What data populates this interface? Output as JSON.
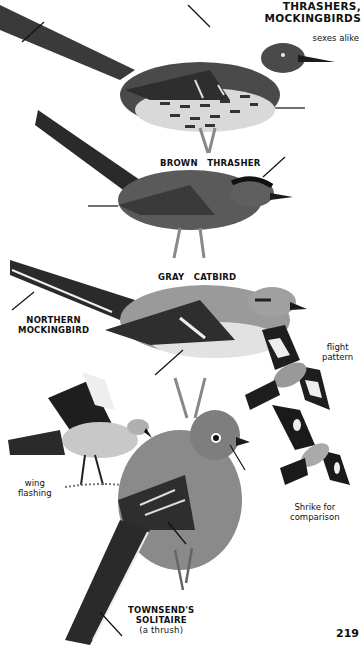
{
  "page": {
    "section_title_line1": "THRASHERS,",
    "section_title_line2": "MOCKINGBIRDS",
    "sexes_note": "sexes alike",
    "page_number": "219"
  },
  "species": [
    {
      "name_line1": "BROWN",
      "name_line2": "THRASHER"
    },
    {
      "name_line1": "GRAY",
      "name_line2": "CATBIRD"
    },
    {
      "name_line1": "NORTHERN",
      "name_line2": "MOCKINGBIRD"
    },
    {
      "name_line1": "TOWNSEND'S",
      "name_line2": "SOLITAIRE",
      "name_line3": "(a thrush)"
    }
  ],
  "captions": {
    "flight_line1": "flight",
    "flight_line2": "pattern",
    "wing_line1": "wing",
    "wing_line2": "flashing",
    "shrike_line1": "Shrike for",
    "shrike_line2": "comparison"
  },
  "colors": {
    "paper": "#ffffff",
    "ink": "#111111",
    "dark_plumage": "#2a2a2a",
    "mid_gray": "#6e6e6e",
    "light_gray": "#bdbdbd"
  }
}
